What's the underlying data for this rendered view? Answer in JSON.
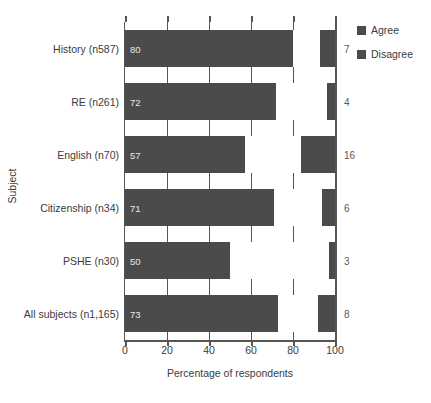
{
  "chart_data": {
    "type": "bar",
    "orientation": "horizontal",
    "title": "",
    "xlabel": "Percentage of respondents",
    "ylabel": "Subject",
    "xlim": [
      0,
      100
    ],
    "xticks": [
      0,
      20,
      40,
      60,
      80,
      100
    ],
    "grid": true,
    "legend_position": "right",
    "categories": [
      "History (n587)",
      "RE (n261)",
      "English (n70)",
      "Citizenship (n34)",
      "PSHE (n30)",
      "All subjects (n1,165)"
    ],
    "series": [
      {
        "name": "Agree",
        "values": [
          80,
          72,
          57,
          71,
          50,
          73
        ]
      },
      {
        "name": "Disagree",
        "values": [
          7,
          4,
          16,
          6,
          3,
          8
        ]
      }
    ],
    "colors": {
      "agree": "#4b4b4b",
      "disagree": "#4b4b4b",
      "neutral_gap": "#ffffff",
      "axis": "#555555",
      "bar_value_text": "#e8e8e8",
      "right_value_text": "#5a5a5a"
    }
  },
  "legend": {
    "items": [
      {
        "label": "Agree",
        "color": "#4b4b4b"
      },
      {
        "label": "Disagree",
        "color": "#4b4b4b"
      }
    ]
  },
  "axes": {
    "x_title": "Percentage of respondents",
    "y_title": "Subject",
    "x_tick_labels": [
      "0",
      "20",
      "40",
      "60",
      "80",
      "100"
    ]
  },
  "rows": [
    {
      "label": "History (n587)",
      "agree": 80,
      "agree_text": "80",
      "disagree": 7,
      "disagree_text": "7"
    },
    {
      "label": "RE (n261)",
      "agree": 72,
      "agree_text": "72",
      "disagree": 4,
      "disagree_text": "4"
    },
    {
      "label": "English (n70)",
      "agree": 57,
      "agree_text": "57",
      "disagree": 16,
      "disagree_text": "16"
    },
    {
      "label": "Citizenship (n34)",
      "agree": 71,
      "agree_text": "71",
      "disagree": 6,
      "disagree_text": "6"
    },
    {
      "label": "PSHE (n30)",
      "agree": 50,
      "agree_text": "50",
      "disagree": 3,
      "disagree_text": "3"
    },
    {
      "label": "All subjects (n1,165)",
      "agree": 73,
      "agree_text": "73",
      "disagree": 8,
      "disagree_text": "8"
    }
  ]
}
